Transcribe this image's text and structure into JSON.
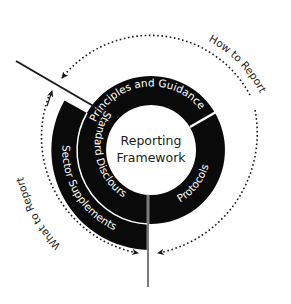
{
  "center": {
    "line1": "Reporting",
    "line2": "Framework"
  },
  "segments": {
    "principles": "Principles and Guidance",
    "protocols": "Protocols",
    "standard": "Standard Disclours",
    "sector": "Sector Supplements"
  },
  "cycle_labels": {
    "how": "How to Report",
    "what": "What to Report"
  },
  "colors": {
    "ring": "#0a0a0a",
    "divider": "#ffffff",
    "text_on_ring": "#ffffff",
    "text": "#1a1a1a",
    "line": "#1a1a1a"
  }
}
